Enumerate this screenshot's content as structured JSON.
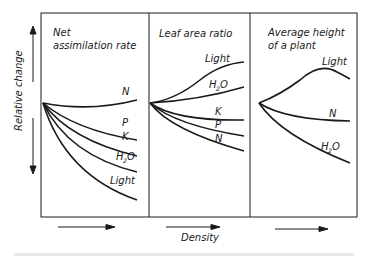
{
  "diagram": {
    "y_axis_label": "Relative change",
    "x_axis_label": "Density",
    "panels": [
      {
        "title_line1": "Net",
        "title_line2": "assimilation rate",
        "curves": [
          {
            "label": "N",
            "trend": "slight increase"
          },
          {
            "label": "P",
            "trend": "decrease"
          },
          {
            "label": "K",
            "trend": "decrease"
          },
          {
            "label": "H2O",
            "trend": "stronger decrease"
          },
          {
            "label": "Light",
            "trend": "strongest decrease"
          }
        ]
      },
      {
        "title_line1": "Leaf area ratio",
        "title_line2": "",
        "curves": [
          {
            "label": "Light",
            "trend": "strong increase"
          },
          {
            "label": "H2O",
            "trend": "increase"
          },
          {
            "label": "K",
            "trend": "slight decrease"
          },
          {
            "label": "P",
            "trend": "decrease"
          },
          {
            "label": "N",
            "trend": "decrease"
          }
        ]
      },
      {
        "title_line1": "Average height",
        "title_line2": "of a plant",
        "curves": [
          {
            "label": "Light",
            "trend": "increase then plateau"
          },
          {
            "label": "N",
            "trend": "slight decrease"
          },
          {
            "label": "H2O",
            "trend": "decrease"
          }
        ]
      }
    ],
    "labels": {
      "N": "N",
      "P": "P",
      "K": "K",
      "H": "H",
      "sub2": "2",
      "O": "O",
      "Light": "Light"
    }
  }
}
